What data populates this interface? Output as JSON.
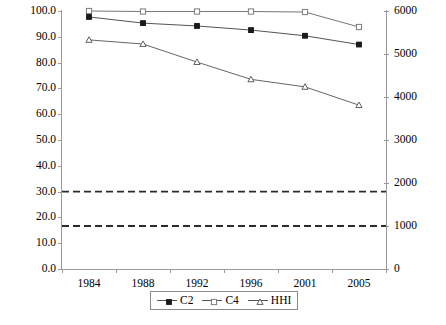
{
  "chart_data": {
    "type": "line",
    "title": "",
    "subtitle": "",
    "xlabel": "",
    "ylabel": "",
    "y2label": "",
    "grid": false,
    "legend_position": "bottom",
    "categories": [
      "1984",
      "1988",
      "1992",
      "1996",
      "2001",
      "2005"
    ],
    "x": [
      1984,
      1988,
      1992,
      1996,
      2001,
      2005
    ],
    "ylim": [
      0.0,
      100.0
    ],
    "ytick_labels": [
      "0.0",
      "10.0",
      "20.0",
      "30.0",
      "40.0",
      "50.0",
      "60.0",
      "70.0",
      "80.0",
      "90.0",
      "100.0"
    ],
    "ytick_values": [
      0.0,
      10.0,
      20.0,
      30.0,
      40.0,
      50.0,
      60.0,
      70.0,
      80.0,
      90.0,
      100.0
    ],
    "y2lim": [
      0,
      6000
    ],
    "y2tick_labels": [
      "0",
      "1000",
      "2000",
      "3000",
      "4000",
      "5000",
      "6000"
    ],
    "y2tick_values": [
      0,
      1000,
      2000,
      3000,
      4000,
      5000,
      6000
    ],
    "series": [
      {
        "name": "C2",
        "axis": "left",
        "marker": "filled-diamond",
        "color": "#555555",
        "values": [
          97.7,
          95.3,
          94.2,
          92.6,
          90.4,
          87.0
        ]
      },
      {
        "name": "C4",
        "axis": "left",
        "marker": "open-square",
        "color": "#777777",
        "values": [
          100.0,
          99.8,
          99.8,
          99.8,
          99.6,
          93.8
        ]
      },
      {
        "name": "HHI",
        "axis": "right",
        "marker": "open-triangle",
        "color": "#666666",
        "values_left_scale": [
          88.8,
          87.2,
          80.2,
          73.5,
          70.6,
          63.5
        ],
        "values": [
          5328,
          5232,
          4812,
          4410,
          4236,
          3810
        ]
      }
    ],
    "reference_lines": [
      {
        "name": "hhi-1800-threshold",
        "axis": "right",
        "value": 1800,
        "value_left_scale": 30.0,
        "style": "dashed",
        "color": "#2b2b2b"
      },
      {
        "name": "hhi-1000-threshold",
        "axis": "right",
        "value": 1000,
        "value_left_scale": 16.7,
        "style": "dashed",
        "color": "#2b2b2b"
      }
    ]
  },
  "legend": {
    "entries": [
      {
        "label": "C2",
        "marker": "filled-diamond"
      },
      {
        "label": "C4",
        "marker": "open-square"
      },
      {
        "label": "HHI",
        "marker": "open-triangle"
      }
    ]
  },
  "colors": {
    "axis": "#9a9a9a",
    "text": "#000000",
    "background": "#ffffff",
    "reference_line": "#2b2b2b"
  }
}
